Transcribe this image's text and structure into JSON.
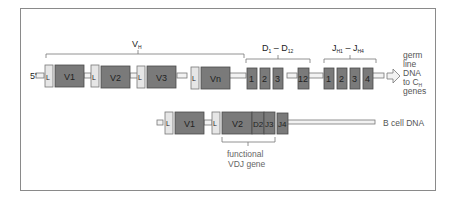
{
  "diagram": {
    "colors": {
      "segment": "#7a7a7a",
      "leader": "#e6e6e6",
      "frame": "#8a8a8a",
      "text": "#5a5a5a"
    },
    "germline": {
      "five_prime": "5'",
      "group_labels": {
        "v": "VH",
        "d": "D1 – D12",
        "j": "JH1 – JH4"
      },
      "v_segments": [
        "V1",
        "V2",
        "V3",
        "Vn"
      ],
      "leader": "L",
      "d_segments": [
        "1",
        "2",
        "3",
        "12"
      ],
      "j_segments": [
        "1",
        "2",
        "3",
        "4"
      ],
      "side_label": [
        "germ",
        "line",
        "DNA",
        "to CH",
        "genes"
      ]
    },
    "bcell": {
      "segments": [
        "V1",
        "V2",
        "D2",
        "J3",
        "J4"
      ],
      "leader": "L",
      "side_label": "B cell DNA",
      "bracket_label": [
        "functional",
        "VDJ gene"
      ]
    }
  }
}
